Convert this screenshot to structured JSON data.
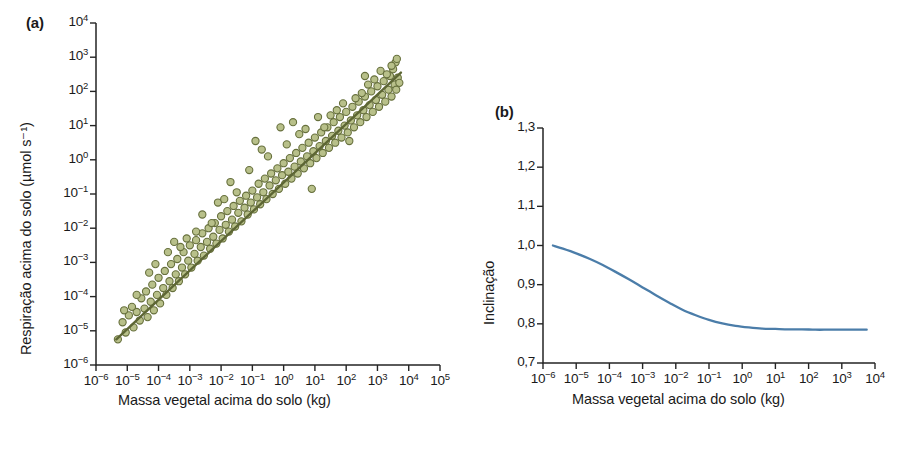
{
  "figure": {
    "panels": [
      {
        "id": "a",
        "label": "(a)",
        "xlabel": "Massa vegetal acima do solo (kg)",
        "ylabel": "Respiração acima do solo (µmol s⁻¹)"
      },
      {
        "id": "b",
        "label": "(b)",
        "xlabel": "Massa vegetal acima do solo (kg)",
        "ylabel": "Inclinação"
      }
    ]
  },
  "chart_data": [
    {
      "type": "scatter",
      "panel": "a",
      "title": "",
      "xlabel": "Massa vegetal acima do solo (kg)",
      "ylabel": "Respiração acima do solo (µmol s⁻¹)",
      "xscale": "log",
      "yscale": "log",
      "xlim": [
        -6,
        5
      ],
      "ylim": [
        -6,
        4
      ],
      "grid": false,
      "legend": null,
      "marker_color": "#b8c08a",
      "marker_edge_color": "#67703d",
      "fit_line_color": "#5d6634",
      "xtick_labels": [
        "10⁻⁶",
        "10⁻⁵",
        "10⁻⁴",
        "10⁻³",
        "10⁻²",
        "10⁻¹",
        "10⁰",
        "10¹",
        "10²",
        "10³",
        "10⁴",
        "10⁵"
      ],
      "xtick_exponents": [
        -6,
        -5,
        -4,
        -3,
        -2,
        -1,
        0,
        1,
        2,
        3,
        4,
        5
      ],
      "ytick_labels": [
        "10⁴",
        "10³",
        "10²",
        "10¹",
        "10⁰",
        "10⁻¹",
        "10⁻²",
        "10⁻³",
        "10⁻⁴",
        "10⁻⁵",
        "10⁻⁶"
      ],
      "ytick_exponents": [
        4,
        3,
        2,
        1,
        0,
        -1,
        -2,
        -3,
        -4,
        -5,
        -6
      ],
      "fit_line": {
        "x_log": [
          -5.35,
          3.75
        ],
        "y_log": [
          -5.25,
          2.55
        ],
        "slope": 0.857,
        "intercept": -0.66
      },
      "points_log10": [
        [
          -5.3,
          -5.25
        ],
        [
          -5.05,
          -5.05
        ],
        [
          -4.95,
          -4.55
        ],
        [
          -5.15,
          -4.75
        ],
        [
          -4.8,
          -4.9
        ],
        [
          -4.7,
          -4.45
        ],
        [
          -4.6,
          -4.7
        ],
        [
          -4.85,
          -4.3
        ],
        [
          -4.45,
          -4.35
        ],
        [
          -4.55,
          -4.05
        ],
        [
          -4.35,
          -4.6
        ],
        [
          -4.25,
          -4.15
        ],
        [
          -4.4,
          -3.85
        ],
        [
          -4.15,
          -4.4
        ],
        [
          -4.05,
          -3.95
        ],
        [
          -4.2,
          -3.65
        ],
        [
          -3.95,
          -4.2
        ],
        [
          -3.85,
          -3.75
        ],
        [
          -4.0,
          -3.45
        ],
        [
          -3.75,
          -3.95
        ],
        [
          -3.65,
          -3.55
        ],
        [
          -3.8,
          -3.25
        ],
        [
          -3.55,
          -3.75
        ],
        [
          -3.45,
          -3.35
        ],
        [
          -3.6,
          -3.05
        ],
        [
          -3.35,
          -3.55
        ],
        [
          -3.25,
          -3.15
        ],
        [
          -3.4,
          -2.9
        ],
        [
          -3.15,
          -3.35
        ],
        [
          -3.05,
          -2.95
        ],
        [
          -3.2,
          -2.7
        ],
        [
          -2.95,
          -3.15
        ],
        [
          -2.85,
          -2.75
        ],
        [
          -3.0,
          -2.5
        ],
        [
          -2.75,
          -2.95
        ],
        [
          -2.65,
          -2.55
        ],
        [
          -2.8,
          -2.35
        ],
        [
          -2.55,
          -2.8
        ],
        [
          -2.45,
          -2.4
        ],
        [
          -2.6,
          -2.15
        ],
        [
          -2.35,
          -2.6
        ],
        [
          -2.25,
          -2.25
        ],
        [
          -2.4,
          -2.0
        ],
        [
          -2.15,
          -2.45
        ],
        [
          -2.05,
          -2.05
        ],
        [
          -2.2,
          -1.85
        ],
        [
          -1.95,
          -2.3
        ],
        [
          -1.85,
          -1.9
        ],
        [
          -2.0,
          -1.65
        ],
        [
          -1.75,
          -2.1
        ],
        [
          -1.65,
          -1.75
        ],
        [
          -1.8,
          -1.5
        ],
        [
          -1.55,
          -1.95
        ],
        [
          -1.45,
          -1.55
        ],
        [
          -1.6,
          -1.35
        ],
        [
          -1.35,
          -1.8
        ],
        [
          -1.25,
          -1.4
        ],
        [
          -1.4,
          -1.2
        ],
        [
          -1.15,
          -1.6
        ],
        [
          -1.05,
          -1.25
        ],
        [
          -1.2,
          -1.05
        ],
        [
          -0.95,
          -1.45
        ],
        [
          -0.85,
          -1.1
        ],
        [
          -1.0,
          -0.9
        ],
        [
          -0.75,
          -1.3
        ],
        [
          -0.65,
          -0.95
        ],
        [
          -0.8,
          -0.7
        ],
        [
          -0.55,
          -1.15
        ],
        [
          -0.45,
          -0.75
        ],
        [
          -0.6,
          -0.55
        ],
        [
          -0.35,
          -1.0
        ],
        [
          -0.25,
          -0.6
        ],
        [
          -0.4,
          -0.4
        ],
        [
          -0.15,
          -0.85
        ],
        [
          -0.05,
          -0.45
        ],
        [
          -0.2,
          -0.25
        ],
        [
          0.05,
          -0.7
        ],
        [
          0.15,
          -0.35
        ],
        [
          0.0,
          -0.1
        ],
        [
          0.25,
          -0.55
        ],
        [
          0.35,
          -0.2
        ],
        [
          0.2,
          0.05
        ],
        [
          0.45,
          -0.4
        ],
        [
          0.55,
          -0.05
        ],
        [
          0.4,
          0.2
        ],
        [
          0.65,
          -0.25
        ],
        [
          0.75,
          0.1
        ],
        [
          0.6,
          0.35
        ],
        [
          0.85,
          -0.1
        ],
        [
          0.95,
          0.25
        ],
        [
          0.8,
          0.5
        ],
        [
          1.05,
          0.05
        ],
        [
          1.15,
          0.4
        ],
        [
          1.0,
          0.65
        ],
        [
          1.25,
          0.2
        ],
        [
          1.35,
          0.55
        ],
        [
          1.2,
          0.8
        ],
        [
          1.45,
          0.35
        ],
        [
          1.55,
          0.7
        ],
        [
          1.4,
          0.95
        ],
        [
          1.65,
          0.5
        ],
        [
          1.75,
          0.85
        ],
        [
          1.6,
          1.1
        ],
        [
          1.85,
          0.65
        ],
        [
          1.95,
          1.0
        ],
        [
          1.8,
          1.25
        ],
        [
          2.05,
          0.8
        ],
        [
          2.15,
          1.15
        ],
        [
          2.0,
          1.4
        ],
        [
          2.25,
          0.95
        ],
        [
          2.35,
          1.3
        ],
        [
          2.2,
          1.55
        ],
        [
          2.45,
          1.1
        ],
        [
          2.55,
          1.45
        ],
        [
          2.4,
          1.7
        ],
        [
          2.65,
          1.25
        ],
        [
          2.75,
          1.6
        ],
        [
          2.6,
          1.85
        ],
        [
          2.85,
          1.4
        ],
        [
          2.95,
          1.75
        ],
        [
          2.8,
          2.0
        ],
        [
          3.05,
          1.55
        ],
        [
          3.15,
          1.9
        ],
        [
          3.0,
          2.15
        ],
        [
          3.25,
          1.7
        ],
        [
          3.35,
          2.05
        ],
        [
          3.2,
          2.3
        ],
        [
          3.45,
          1.85
        ],
        [
          3.55,
          2.2
        ],
        [
          3.4,
          2.45
        ],
        [
          3.6,
          2.05
        ],
        [
          3.65,
          2.4
        ],
        [
          3.5,
          2.65
        ],
        [
          3.7,
          2.25
        ],
        [
          3.58,
          2.85
        ],
        [
          -0.1,
          0.95
        ],
        [
          1.3,
          0.95
        ],
        [
          -2.1,
          -1.25
        ],
        [
          0.9,
          -0.85
        ],
        [
          2.1,
          0.55
        ],
        [
          -3.1,
          -2.3
        ],
        [
          -1.5,
          -0.95
        ],
        [
          0.5,
          0.75
        ],
        [
          1.7,
          1.45
        ],
        [
          2.7,
          2.2
        ],
        [
          -4.3,
          -3.3
        ],
        [
          -2.6,
          -1.6
        ],
        [
          -0.7,
          0.3
        ],
        [
          1.1,
          1.25
        ],
        [
          3.1,
          2.6
        ],
        [
          -3.7,
          -2.7
        ],
        [
          -1.9,
          -1.15
        ],
        [
          0.1,
          0.45
        ],
        [
          2.3,
          1.8
        ],
        [
          3.3,
          2.5
        ],
        [
          -4.7,
          -3.95
        ],
        [
          -2.3,
          -1.85
        ],
        [
          -0.5,
          0.1
        ],
        [
          1.5,
          1.3
        ],
        [
          2.5,
          1.95
        ],
        [
          -5.1,
          -4.4
        ],
        [
          -3.3,
          -2.55
        ],
        [
          -1.1,
          -0.3
        ],
        [
          0.7,
          0.9
        ],
        [
          2.9,
          2.35
        ],
        [
          -4.1,
          -3.05
        ],
        [
          -2.8,
          -2.1
        ],
        [
          -0.9,
          0.55
        ],
        [
          1.9,
          1.65
        ],
        [
          3.45,
          2.75
        ],
        [
          -3.5,
          -2.4
        ],
        [
          -1.7,
          -0.65
        ],
        [
          0.3,
          1.1
        ],
        [
          2.6,
          2.45
        ],
        [
          3.62,
          2.95
        ]
      ]
    },
    {
      "type": "line",
      "panel": "b",
      "title": "",
      "xlabel": "Massa vegetal acima do solo (kg)",
      "ylabel": "Inclinação",
      "xscale": "log",
      "yscale": "linear",
      "xlim": [
        -6,
        4
      ],
      "ylim": [
        0.7,
        1.3
      ],
      "grid": false,
      "legend": null,
      "line_color": "#4b7da9",
      "xtick_labels": [
        "10⁻⁶",
        "10⁻⁵",
        "10⁻⁴",
        "10⁻³",
        "10⁻²",
        "10⁻¹",
        "10⁰",
        "10¹",
        "10²",
        "10³",
        "10⁴"
      ],
      "xtick_exponents": [
        -6,
        -5,
        -4,
        -3,
        -2,
        -1,
        0,
        1,
        2,
        3,
        4
      ],
      "ytick_labels": [
        "1,3",
        "1,2",
        "1,1",
        "1,0",
        "0,9",
        "0,8",
        "0,7"
      ],
      "ytick_values": [
        1.3,
        1.2,
        1.1,
        1.0,
        0.9,
        0.8,
        0.7
      ],
      "x_log": [
        -5.7,
        -5.4,
        -5.0,
        -4.6,
        -4.2,
        -3.8,
        -3.4,
        -3.0,
        -2.6,
        -2.2,
        -1.8,
        -1.4,
        -1.0,
        -0.6,
        -0.2,
        0.2,
        0.6,
        1.0,
        1.4,
        1.8,
        2.2,
        2.6,
        3.0,
        3.4,
        3.75
      ],
      "values": [
        1.0,
        0.992,
        0.98,
        0.966,
        0.95,
        0.932,
        0.913,
        0.893,
        0.873,
        0.854,
        0.836,
        0.822,
        0.81,
        0.801,
        0.795,
        0.791,
        0.788,
        0.787,
        0.786,
        0.786,
        0.785,
        0.785,
        0.785,
        0.785,
        0.785
      ]
    }
  ]
}
